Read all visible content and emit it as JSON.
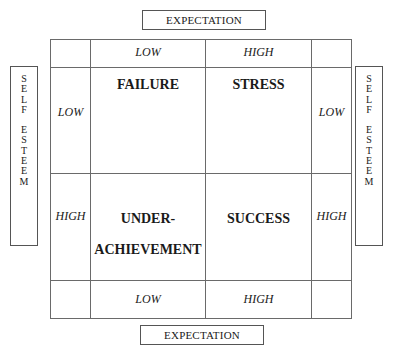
{
  "diagram": {
    "top_axis": {
      "label": "EXPECTATION"
    },
    "bottom_axis": {
      "label": "EXPECTATION"
    },
    "left_axis": {
      "label": "SELF ESTEEM",
      "letters": [
        "S",
        "E",
        "L",
        "F",
        "",
        "E",
        "S",
        "T",
        "E",
        "E",
        "M"
      ]
    },
    "right_axis": {
      "label": "SELF ESTEEM",
      "letters": [
        "S",
        "E",
        "L",
        "F",
        "",
        "E",
        "S",
        "T",
        "E",
        "E",
        "M"
      ]
    },
    "columns": {
      "low": "LOW",
      "high": "HIGH"
    },
    "rows": {
      "low": "LOW",
      "high": "HIGH"
    },
    "quadrants": {
      "low_low": "FAILURE",
      "low_high": "STRESS",
      "high_low": [
        "UNDER-",
        "ACHIEVEMENT"
      ],
      "high_high": "SUCCESS"
    }
  }
}
